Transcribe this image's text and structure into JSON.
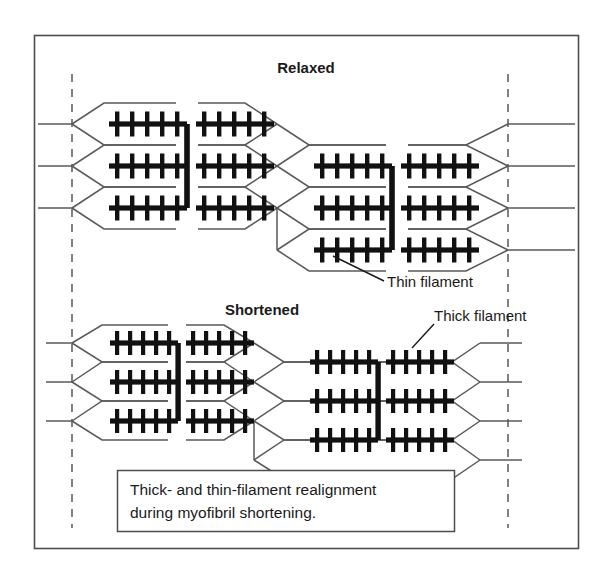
{
  "figure": {
    "title_top": "Relaxed",
    "title_bottom": "Shortened",
    "frame_color": "#4d4d4d",
    "filament_color": "#111111",
    "thin_color": "#595959",
    "dash_color": "#6b6b6b",
    "background": "#ffffff"
  },
  "labels": {
    "thin_filament": "Thin filament",
    "thick_filament": "Thick filament"
  },
  "caption": {
    "line1": "Thick- and thin-filament realignment",
    "line2": "during myofibril shortening."
  },
  "diagram_data": {
    "type": "diagram",
    "subject": "sarcomere thick- and thin-filament realignment during myofibril shortening",
    "panels": [
      {
        "name": "relaxed",
        "title": "Relaxed",
        "rows": 3,
        "sarcomere_groups": 2,
        "group_vertical_offset_px": 42,
        "sarcomere_length_px": 205,
        "note": "second group offset downward by half a row spacing; sarcomeres long and in register"
      },
      {
        "name": "shortened",
        "title": "Shortened",
        "rows": 3,
        "sarcomere_groups": 2,
        "group_vertical_offset_px": 42,
        "sarcomere_length_px": 182,
        "note": "filaments slide together, sarcomeres compressed, Z lines closer"
      }
    ],
    "thick_filament": {
      "half_count": 2,
      "crossbridges_per_half": 5,
      "orientation": "horizontal bold bar with vertical cross-bridge ticks above and below",
      "m_line": "vertical bold bar joining the three thick filaments of a group"
    },
    "thin_filament": {
      "orientation": "thin lines radiating from Z-line anchor points in chevron pattern",
      "anchor": "Z line (vertical dashed reference lines)"
    },
    "reference_lines": {
      "style": "dashed vertical",
      "count": 2,
      "meaning": "fixed reference planes showing shortening between relaxed and shortened states"
    }
  }
}
